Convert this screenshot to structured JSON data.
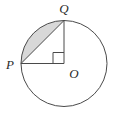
{
  "figure": {
    "background_color": "#ffffff",
    "stroke_color": "#4a4a4a",
    "shaded_fill_color": "#d8d8d8",
    "stroke_width": 1,
    "circle": {
      "center_x": 64,
      "center_y": 63.5,
      "radius": 43,
      "center_label": "O"
    },
    "points": {
      "P": {
        "x": 21,
        "y": 63.5,
        "label": "P",
        "label_x": 10,
        "label_y": 69
      },
      "Q": {
        "x": 64,
        "y": 20.5,
        "label": "Q",
        "label_x": 64,
        "label_y": 13
      },
      "O": {
        "x": 64,
        "y": 63.5,
        "label": "O",
        "label_x": 74,
        "label_y": 78
      }
    },
    "segments": [
      {
        "name": "radius-PO",
        "x1": 21,
        "y1": 63.5,
        "x2": 64,
        "y2": 63.5
      },
      {
        "name": "radius-QO",
        "x1": 64,
        "y1": 20.5,
        "x2": 64,
        "y2": 63.5
      },
      {
        "name": "chord-PQ",
        "x1": 21,
        "y1": 63.5,
        "x2": 64,
        "y2": 20.5
      }
    ],
    "right_angle_marker": {
      "at_point": "O",
      "size": 11,
      "x": 53,
      "y": 52.5
    },
    "shaded_region": {
      "description": "circular segment between chord PQ and minor arc PQ",
      "path": "M 21 63.5 A 43 43 0 0 1 64 20.5 L 21 63.5 Z"
    },
    "labels": [
      "P",
      "Q",
      "O"
    ]
  }
}
